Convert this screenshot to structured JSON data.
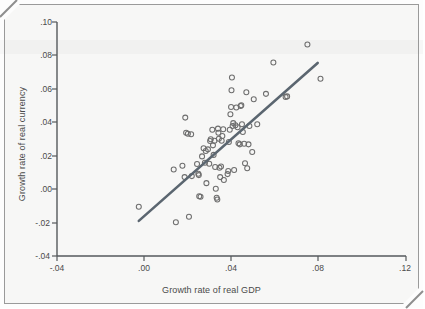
{
  "chart_data": {
    "type": "scatter",
    "title": "",
    "xlabel": "Growth rate of real GDP",
    "ylabel": "Growth rate of real currency",
    "xlim": [
      -0.04,
      0.12
    ],
    "ylim": [
      -0.04,
      0.1
    ],
    "grid": false,
    "legend": "none",
    "xticks": [
      -0.04,
      0.0,
      0.04,
      0.08,
      0.12
    ],
    "xtick_labels": [
      "-.04",
      ".00",
      ".04",
      ".08",
      ".12"
    ],
    "yticks": [
      -0.04,
      -0.02,
      0.0,
      0.02,
      0.04,
      0.06,
      0.08,
      0.1
    ],
    "ytick_labels": [
      "-.04",
      "-.02",
      ".00",
      ".02",
      ".04",
      ".06",
      ".08",
      ".10"
    ],
    "marker": "open-circle",
    "marker_color": "#6e6e6e",
    "line_color": "#5b6670",
    "fit_line": {
      "name": "linear fit",
      "x_start": -0.0025,
      "y_start": -0.019,
      "x_end": 0.0795,
      "y_end": 0.0755
    },
    "series": [
      {
        "name": "countries",
        "points": [
          [
            -0.0025,
            -0.0105
          ],
          [
            0.0135,
            0.0118
          ],
          [
            0.0145,
            -0.0198
          ],
          [
            0.0175,
            0.014
          ],
          [
            0.0185,
            0.0072
          ],
          [
            0.0188,
            0.0428
          ],
          [
            0.0192,
            0.0338
          ],
          [
            0.02,
            0.0332
          ],
          [
            0.0205,
            -0.0165
          ],
          [
            0.0215,
            0.0328
          ],
          [
            0.0218,
            0.0078
          ],
          [
            0.0242,
            0.015
          ],
          [
            0.0248,
            0.0092
          ],
          [
            0.025,
            0.0084
          ],
          [
            0.0252,
            -0.0042
          ],
          [
            0.0258,
            -0.0045
          ],
          [
            0.0265,
            0.0196
          ],
          [
            0.0272,
            0.0245
          ],
          [
            0.0278,
            0.0158
          ],
          [
            0.0282,
            0.0228
          ],
          [
            0.0285,
            0.0036
          ],
          [
            0.0292,
            0.0238
          ],
          [
            0.0298,
            0.0152
          ],
          [
            0.0302,
            0.0288
          ],
          [
            0.0305,
            0.0298
          ],
          [
            0.0312,
            0.0355
          ],
          [
            0.0315,
            0.0262
          ],
          [
            0.0318,
            0.0205
          ],
          [
            0.0322,
            0.029
          ],
          [
            0.0325,
            0.0132
          ],
          [
            0.0328,
            0.0002
          ],
          [
            0.0332,
            -0.0052
          ],
          [
            0.0335,
            -0.0062
          ],
          [
            0.0338,
            0.0362
          ],
          [
            0.034,
            0.0338
          ],
          [
            0.0342,
            0.0302
          ],
          [
            0.0345,
            0.0128
          ],
          [
            0.0348,
            0.0072
          ],
          [
            0.0352,
            0.0135
          ],
          [
            0.0355,
            0.029
          ],
          [
            0.0358,
            0.0318
          ],
          [
            0.0362,
            0.0358
          ],
          [
            0.0365,
            0.0055
          ],
          [
            0.0382,
            0.009
          ],
          [
            0.0385,
            0.0108
          ],
          [
            0.0388,
            0.0282
          ],
          [
            0.0392,
            0.0355
          ],
          [
            0.0395,
            0.0448
          ],
          [
            0.0398,
            0.0492
          ],
          [
            0.04,
            0.0592
          ],
          [
            0.0402,
            0.0668
          ],
          [
            0.0405,
            0.0378
          ],
          [
            0.0408,
            0.0395
          ],
          [
            0.0412,
            0.0115
          ],
          [
            0.0418,
            0.0382
          ],
          [
            0.0422,
            0.0488
          ],
          [
            0.0428,
            0.037
          ],
          [
            0.0432,
            0.0275
          ],
          [
            0.0438,
            0.0268
          ],
          [
            0.0442,
            0.0498
          ],
          [
            0.0445,
            0.0502
          ],
          [
            0.0448,
            0.0388
          ],
          [
            0.0452,
            0.0342
          ],
          [
            0.0458,
            0.0272
          ],
          [
            0.0462,
            0.0155
          ],
          [
            0.0468,
            0.058
          ],
          [
            0.0472,
            0.0125
          ],
          [
            0.0478,
            0.0268
          ],
          [
            0.0482,
            0.0378
          ],
          [
            0.0495,
            0.0222
          ],
          [
            0.0502,
            0.0538
          ],
          [
            0.0518,
            0.0388
          ],
          [
            0.0558,
            0.057
          ],
          [
            0.0592,
            0.0758
          ],
          [
            0.0648,
            0.0552
          ],
          [
            0.0655,
            0.0555
          ],
          [
            0.0748,
            0.0865
          ],
          [
            0.0808,
            0.066
          ]
        ]
      }
    ]
  },
  "axes": {
    "x_title": "Growth rate of real GDP",
    "y_title": "Growth rate of real currency"
  }
}
